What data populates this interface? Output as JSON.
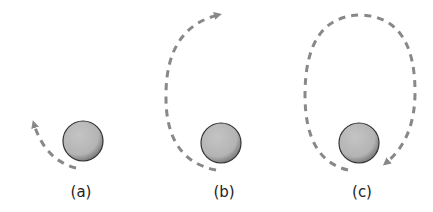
{
  "figure": {
    "panels": [
      {
        "label": "(a)",
        "planet": {
          "cx": 83,
          "cy": 141,
          "r": 20
        },
        "label_x": 81,
        "orbit": "short arc"
      },
      {
        "label": "(b)",
        "planet": {
          "cx": 221,
          "cy": 143,
          "r": 20
        },
        "label_x": 224,
        "orbit": "half ellipse"
      },
      {
        "label": "(c)",
        "planet": {
          "cx": 359,
          "cy": 143,
          "r": 20
        },
        "label_x": 362,
        "orbit": "nearly closed ellipse"
      }
    ],
    "colors": {
      "planet_fill": "#b8b8b8",
      "planet_stroke": "#333333",
      "orbit": "#888888"
    }
  }
}
